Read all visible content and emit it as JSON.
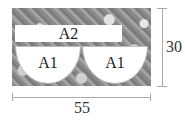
{
  "pieces": {
    "a2": "A2",
    "a1_left": "A1",
    "a1_right": "A1"
  },
  "dimensions": {
    "width": "55",
    "height": "30"
  }
}
